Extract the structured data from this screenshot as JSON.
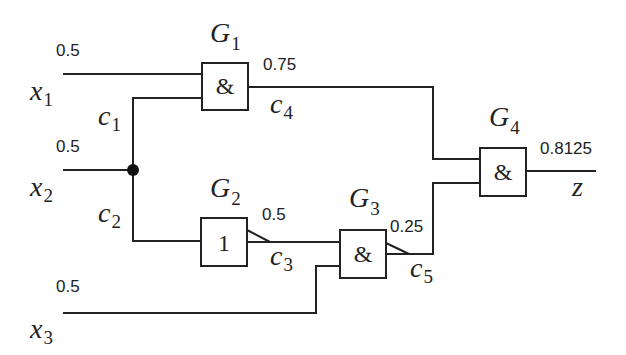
{
  "inputs": [
    {
      "name": "x",
      "sub": "1",
      "prob": "0.5"
    },
    {
      "name": "x",
      "sub": "2",
      "prob": "0.5"
    },
    {
      "name": "x",
      "sub": "3",
      "prob": "0.5"
    }
  ],
  "gates": [
    {
      "name": "G",
      "sub": "1",
      "symbol": "&",
      "out_prob": "0.75",
      "out_line": {
        "name": "c",
        "sub": "4"
      }
    },
    {
      "name": "G",
      "sub": "2",
      "symbol": "1",
      "out_prob": "0.5",
      "out_line": {
        "name": "c",
        "sub": "3"
      }
    },
    {
      "name": "G",
      "sub": "3",
      "symbol": "&",
      "out_prob": "0.25",
      "out_line": {
        "name": "c",
        "sub": "5"
      }
    },
    {
      "name": "G",
      "sub": "4",
      "symbol": "&",
      "out_prob": "0.8125",
      "out_line": {
        "name": "z",
        "sub": ""
      }
    }
  ],
  "branches": [
    {
      "name": "c",
      "sub": "1"
    },
    {
      "name": "c",
      "sub": "2"
    }
  ],
  "colors": {
    "line": "#222222",
    "background": "#ffffff"
  }
}
